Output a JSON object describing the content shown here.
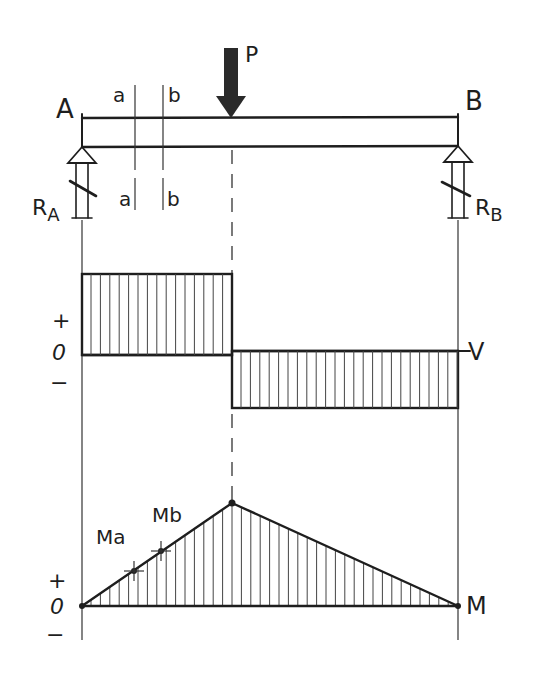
{
  "diagram": {
    "beam": {
      "left_support_label": "A",
      "right_support_label": "B",
      "load_label": "P",
      "section_labels_top": [
        "a",
        "b"
      ],
      "section_labels_bottom": [
        "a",
        "b"
      ],
      "reaction_left_label": "R",
      "reaction_left_sub": "A",
      "reaction_right_label": "R",
      "reaction_right_sub": "B"
    },
    "shear_diagram": {
      "label": "V",
      "sign_plus": "+",
      "sign_zero": "0",
      "sign_minus": "−"
    },
    "moment_diagram": {
      "label": "M",
      "point_a_label": "Ma",
      "point_b_label": "Mb",
      "sign_plus": "+",
      "sign_zero": "0",
      "sign_minus": "−"
    },
    "colors": {
      "ink": "#1e1e1e",
      "load_fill": "#2a2a2a",
      "background": "#ffffff"
    }
  }
}
